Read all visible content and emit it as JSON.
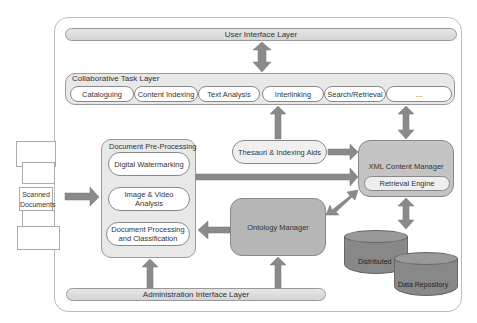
{
  "diagram": {
    "layers": {
      "user_interface": "User Interface Layer",
      "collaborative": "Collaborative Task Layer",
      "administration": "Administration Interface Layer"
    },
    "collaborative_tasks": [
      "Cataloguing",
      "Content Indexing",
      "Text Analysis",
      "Interlinking",
      "Search/Retrieval",
      "..."
    ],
    "pre_processing": {
      "title": "Document Pre-Processing",
      "items": [
        "Digital Watermarking",
        "Image & Video Analysis",
        "Document Processing and Classification"
      ]
    },
    "scanned_documents": "Scanned Documents",
    "thesauri": "Thesauri & Indexing Aids",
    "xml_manager": {
      "title": "XML Content Manager",
      "retrieval": "Retrieval Engine"
    },
    "ontology_manager": "Ontology Manager",
    "repository": {
      "left": "Distributed",
      "right": "Data Repository"
    },
    "colors": {
      "arrow": "#8a8a8a",
      "pill_bg": "#ffffff",
      "group_bg": "#e8e8e8",
      "dark_box": "#b6b6b6",
      "cylinder": "#888888"
    }
  }
}
